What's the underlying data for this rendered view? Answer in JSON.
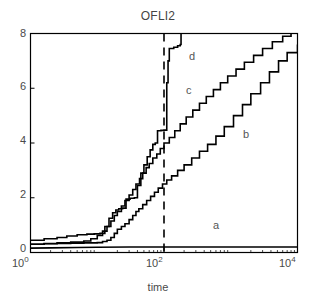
{
  "chart_data": {
    "type": "line",
    "title": "OFLI2",
    "xlabel": "time",
    "ylabel": "",
    "xscale": "log",
    "yscale": "linear",
    "xlim": [
      1,
      10000
    ],
    "ylim": [
      0,
      8
    ],
    "grid": false,
    "legend_position": "inline-annotations",
    "xticks": [
      {
        "value": 1,
        "label": "10",
        "exponent": "0"
      },
      {
        "value": 100,
        "label": "10",
        "exponent": "2"
      },
      {
        "value": 10000,
        "label": "10",
        "exponent": "4"
      }
    ],
    "yticks": [
      0,
      2,
      4,
      6,
      8
    ],
    "annotations": [
      {
        "text": "a",
        "x": 1500,
        "y": 0.95
      },
      {
        "text": "b",
        "x": 2600,
        "y": 4.25
      },
      {
        "text": "c",
        "x": 330,
        "y": 5.85
      },
      {
        "text": "d",
        "x": 250,
        "y": 7.1
      }
    ],
    "reference_line": {
      "type": "vertical-dashed",
      "x": 100,
      "style": "dashed",
      "color": "#000000"
    },
    "series": [
      {
        "name": "a",
        "color": "#000000",
        "points": [
          [
            1,
            0.16
          ],
          [
            2,
            0.17
          ],
          [
            5,
            0.18
          ],
          [
            10,
            0.19
          ],
          [
            30,
            0.2
          ],
          [
            100,
            0.2
          ],
          [
            300,
            0.2
          ],
          [
            1000,
            0.2
          ],
          [
            3000,
            0.2
          ],
          [
            10000,
            0.2
          ]
        ]
      },
      {
        "name": "b",
        "color": "#000000",
        "points": [
          [
            1,
            0.3
          ],
          [
            1.6,
            0.32
          ],
          [
            2.5,
            0.33
          ],
          [
            4,
            0.34
          ],
          [
            6.3,
            0.35
          ],
          [
            10,
            0.36
          ],
          [
            12,
            0.4
          ],
          [
            14,
            0.45
          ],
          [
            16,
            0.55
          ],
          [
            18,
            0.7
          ],
          [
            20,
            0.85
          ],
          [
            23,
            0.95
          ],
          [
            26,
            1.05
          ],
          [
            30,
            1.2
          ],
          [
            34,
            1.35
          ],
          [
            38,
            1.5
          ],
          [
            42,
            1.6
          ],
          [
            48,
            1.75
          ],
          [
            55,
            1.9
          ],
          [
            63,
            2.05
          ],
          [
            72,
            2.2
          ],
          [
            82,
            2.35
          ],
          [
            95,
            2.5
          ],
          [
            110,
            2.65
          ],
          [
            130,
            2.8
          ],
          [
            160,
            3.0
          ],
          [
            200,
            3.2
          ],
          [
            260,
            3.45
          ],
          [
            340,
            3.7
          ],
          [
            450,
            3.95
          ],
          [
            600,
            4.25
          ],
          [
            800,
            4.6
          ],
          [
            1100,
            5.0
          ],
          [
            1500,
            5.4
          ],
          [
            2000,
            5.8
          ],
          [
            2800,
            6.2
          ],
          [
            3800,
            6.6
          ],
          [
            5200,
            7.0
          ],
          [
            7000,
            7.3
          ],
          [
            10000,
            7.6
          ]
        ]
      },
      {
        "name": "c",
        "color": "#000000",
        "points": [
          [
            1,
            0.3
          ],
          [
            1.6,
            0.33
          ],
          [
            2.5,
            0.35
          ],
          [
            4,
            0.38
          ],
          [
            6.3,
            0.42
          ],
          [
            8,
            0.5
          ],
          [
            10,
            0.62
          ],
          [
            12,
            0.78
          ],
          [
            14,
            0.95
          ],
          [
            16,
            1.15
          ],
          [
            18,
            1.35
          ],
          [
            20,
            1.5
          ],
          [
            23,
            1.7
          ],
          [
            26,
            1.9
          ],
          [
            30,
            2.1
          ],
          [
            34,
            2.3
          ],
          [
            38,
            2.5
          ],
          [
            43,
            2.7
          ],
          [
            48,
            2.9
          ],
          [
            54,
            3.1
          ],
          [
            60,
            3.25
          ],
          [
            68,
            3.45
          ],
          [
            78,
            3.6
          ],
          [
            88,
            3.8
          ],
          [
            100,
            4.0
          ],
          [
            120,
            4.2
          ],
          [
            145,
            4.45
          ],
          [
            175,
            4.7
          ],
          [
            215,
            4.95
          ],
          [
            270,
            5.2
          ],
          [
            340,
            5.45
          ],
          [
            430,
            5.7
          ],
          [
            550,
            5.95
          ],
          [
            700,
            6.2
          ],
          [
            900,
            6.45
          ],
          [
            1200,
            6.7
          ],
          [
            1600,
            6.95
          ],
          [
            2200,
            7.2
          ],
          [
            3000,
            7.45
          ],
          [
            4200,
            7.7
          ],
          [
            6000,
            7.9
          ],
          [
            8000,
            8.0
          ]
        ]
      },
      {
        "name": "d",
        "color": "#000000",
        "points": [
          [
            1,
            0.45
          ],
          [
            1.6,
            0.5
          ],
          [
            2.5,
            0.55
          ],
          [
            3.5,
            0.6
          ],
          [
            5,
            0.65
          ],
          [
            7,
            0.67
          ],
          [
            9,
            0.68
          ],
          [
            11,
            0.7
          ],
          [
            13,
            0.95
          ],
          [
            15,
            1.25
          ],
          [
            17,
            1.45
          ],
          [
            19,
            1.55
          ],
          [
            21,
            1.6
          ],
          [
            24,
            1.62
          ],
          [
            27,
            1.95
          ],
          [
            31,
            1.98
          ],
          [
            36,
            2.0
          ],
          [
            40,
            2.45
          ],
          [
            45,
            2.9
          ],
          [
            50,
            3.2
          ],
          [
            56,
            3.5
          ],
          [
            62,
            3.75
          ],
          [
            68,
            3.95
          ],
          [
            74,
            4.0
          ],
          [
            80,
            4.45
          ],
          [
            90,
            4.46
          ],
          [
            100,
            4.47
          ],
          [
            105,
            4.47
          ],
          [
            110,
            6.2
          ],
          [
            115,
            7.0
          ],
          [
            120,
            7.45
          ],
          [
            140,
            7.5
          ],
          [
            160,
            7.55
          ],
          [
            175,
            7.6
          ],
          [
            180,
            8.0
          ]
        ]
      }
    ]
  }
}
